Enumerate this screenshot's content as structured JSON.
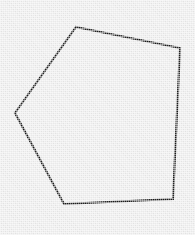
{
  "image": {
    "title": "Pentagon outline on light gray textured background",
    "width": 195,
    "height": 235,
    "background_color": "#e9e9e9",
    "stroke_color": "#181818",
    "fill_color": "none",
    "stroke_width": 2.1,
    "texture": "dithered halftone scan noise"
  },
  "shape": {
    "name": "pentagon",
    "sides": 5,
    "closed": true,
    "filled": false,
    "points_attr": "76,27 180,48 173,199 64,204 15,113",
    "vertices": [
      {
        "label": "top",
        "x": 76,
        "y": 27
      },
      {
        "label": "upper-right",
        "x": 180,
        "y": 48
      },
      {
        "label": "lower-right",
        "x": 173,
        "y": 199
      },
      {
        "label": "lower-left",
        "x": 64,
        "y": 204
      },
      {
        "label": "left",
        "x": 15,
        "y": 113
      }
    ],
    "edges": [
      {
        "from": "top",
        "to": "upper-right"
      },
      {
        "from": "upper-right",
        "to": "lower-right"
      },
      {
        "from": "lower-right",
        "to": "lower-left"
      },
      {
        "from": "lower-left",
        "to": "left"
      },
      {
        "from": "left",
        "to": "top"
      }
    ]
  }
}
